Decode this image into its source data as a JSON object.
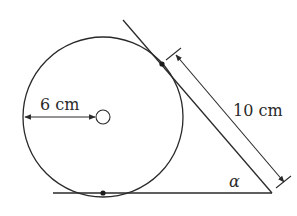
{
  "diagram": {
    "type": "geometry",
    "labels": {
      "radius": "6 cm",
      "tangent_length": "10 cm",
      "angle": "α"
    },
    "elements": {
      "circle": {
        "cx": 103,
        "cy": 117,
        "r": 80
      },
      "center_mark": {
        "cx": 103,
        "cy": 117,
        "r": 7
      },
      "base_line": {
        "x1": 53,
        "y1": 193,
        "x2": 272,
        "y2": 193
      },
      "tangent_line": {
        "x1": 123,
        "y1": 20,
        "x2": 272,
        "y2": 193
      },
      "tangent_point_bottom": {
        "cx": 103,
        "cy": 193
      },
      "tangent_point_slant": {
        "cx": 162,
        "cy": 64
      }
    },
    "colors": {
      "stroke": "#2a2a2a",
      "background": "#ffffff"
    }
  }
}
